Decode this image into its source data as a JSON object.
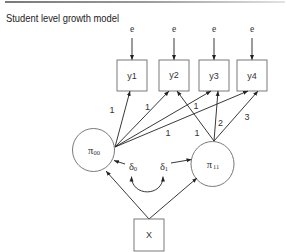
{
  "title": "Student level growth model",
  "diagram": {
    "errors": [
      {
        "label": "e"
      },
      {
        "label": "e"
      },
      {
        "label": "e"
      },
      {
        "label": "e"
      }
    ],
    "observed": [
      {
        "label": "y1"
      },
      {
        "label": "y2"
      },
      {
        "label": "y3"
      },
      {
        "label": "y4"
      }
    ],
    "latent": {
      "intercept": {
        "symbol": "π",
        "subscript": "00"
      },
      "slope": {
        "symbol": "π",
        "subscript": "11"
      }
    },
    "disturbances": [
      {
        "symbol": "δ",
        "subscript": "0"
      },
      {
        "symbol": "δ",
        "subscript": "1"
      }
    ],
    "covariate": {
      "label": "X"
    },
    "loadings": {
      "intercept": [
        {
          "to": "y1",
          "value": "1"
        },
        {
          "to": "y2",
          "value": "1"
        },
        {
          "to": "y3",
          "value": "1"
        },
        {
          "to": "y4",
          "value": "1"
        }
      ],
      "slope": [
        {
          "to": "y2",
          "value": "1"
        },
        {
          "to": "y3",
          "value": "2"
        },
        {
          "to": "y4",
          "value": "3"
        }
      ]
    },
    "colors": {
      "line": "#222222",
      "box_stroke": "#6b6b6b",
      "rule": "#8a8a8a"
    }
  }
}
